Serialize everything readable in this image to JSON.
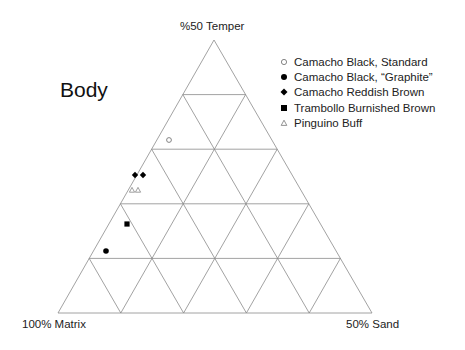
{
  "chart_data": {
    "type": "scatter",
    "subtype": "ternary",
    "title": "Body",
    "axes": {
      "top": "%50 Temper",
      "left": "100% Matrix",
      "right": "50% Sand"
    },
    "grid": true,
    "grid_divisions": 5,
    "legend_position": "top-right",
    "series": [
      {
        "name": "Camacho Black, Standard",
        "marker": "open-circle",
        "points": [
          {
            "x": 169,
            "y": 140
          }
        ]
      },
      {
        "name": "Camacho Black, “Graphite”",
        "marker": "filled-circle",
        "points": [
          {
            "x": 106,
            "y": 251
          }
        ]
      },
      {
        "name": "Camacho Reddish Brown",
        "marker": "filled-diamond",
        "points": [
          {
            "x": 135,
            "y": 175
          },
          {
            "x": 143,
            "y": 175
          }
        ]
      },
      {
        "name": "Trambollo Burnished Brown",
        "marker": "filled-square",
        "points": [
          {
            "x": 127,
            "y": 224
          }
        ]
      },
      {
        "name": "Pinguino Buff",
        "marker": "open-triangle",
        "points": [
          {
            "x": 132,
            "y": 190
          },
          {
            "x": 138,
            "y": 190
          }
        ]
      }
    ]
  },
  "labels": {
    "title": "Body",
    "top": "%50 Temper",
    "left": "100% Matrix",
    "right": "50% Sand"
  },
  "legend": [
    {
      "label": "Camacho Black, Standard",
      "marker": "open-circle"
    },
    {
      "label": "Camacho Black, “Graphite”",
      "marker": "filled-circle"
    },
    {
      "label": "Camacho Reddish Brown",
      "marker": "filled-diamond"
    },
    {
      "label": "Trambollo Burnished Brown",
      "marker": "filled-square"
    },
    {
      "label": "Pinguino Buff",
      "marker": "open-triangle"
    }
  ],
  "colors": {
    "grid": "#8a8a8a",
    "marker_fill": "#000000",
    "open_marker_stroke": "#777777"
  }
}
